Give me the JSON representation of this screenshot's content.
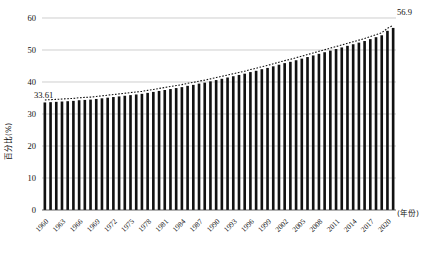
{
  "chart_data": {
    "type": "bar",
    "title": "",
    "subtitle": "",
    "xlabel": "(年份)",
    "ylabel": "百分比(%)",
    "ylim": [
      0,
      60
    ],
    "yticks": [
      0,
      10,
      20,
      30,
      40,
      50,
      60
    ],
    "grid": true,
    "legend": null,
    "annotations": [
      {
        "text": "33.61",
        "x": "1960",
        "value": 33.61
      },
      {
        "text": "56.9",
        "x": "2021",
        "value": 56.9
      }
    ],
    "xtick_labels": [
      "1960",
      "1963",
      "1966",
      "1969",
      "1972",
      "1975",
      "1978",
      "1981",
      "1984",
      "1987",
      "1990",
      "1993",
      "1996",
      "1999",
      "2002",
      "2005",
      "2008",
      "2011",
      "2014",
      "2017",
      "2020"
    ],
    "categories": [
      "1960",
      "1961",
      "1962",
      "1963",
      "1964",
      "1965",
      "1966",
      "1967",
      "1968",
      "1969",
      "1970",
      "1971",
      "1972",
      "1973",
      "1974",
      "1975",
      "1976",
      "1977",
      "1978",
      "1979",
      "1980",
      "1981",
      "1982",
      "1983",
      "1984",
      "1985",
      "1986",
      "1987",
      "1988",
      "1989",
      "1990",
      "1991",
      "1992",
      "1993",
      "1994",
      "1995",
      "1996",
      "1997",
      "1998",
      "1999",
      "2000",
      "2001",
      "2002",
      "2003",
      "2004",
      "2005",
      "2006",
      "2007",
      "2008",
      "2009",
      "2010",
      "2011",
      "2012",
      "2013",
      "2014",
      "2015",
      "2016",
      "2017",
      "2018",
      "2019",
      "2020",
      "2021"
    ],
    "values": [
      33.61,
      33.7,
      33.8,
      33.9,
      34.0,
      34.1,
      34.3,
      34.4,
      34.5,
      34.7,
      34.9,
      35.1,
      35.3,
      35.5,
      35.7,
      35.9,
      36.1,
      36.3,
      36.6,
      36.9,
      37.2,
      37.5,
      37.8,
      38.1,
      38.4,
      38.8,
      39.1,
      39.5,
      39.8,
      40.2,
      40.6,
      41.0,
      41.4,
      41.8,
      42.2,
      42.6,
      43.1,
      43.5,
      44.0,
      44.4,
      44.9,
      45.4,
      45.9,
      46.3,
      46.8,
      47.3,
      47.8,
      48.3,
      48.8,
      49.3,
      49.8,
      50.3,
      50.8,
      51.3,
      51.8,
      52.3,
      52.8,
      53.4,
      54.0,
      54.6,
      56.0,
      56.9
    ],
    "series_overlay": {
      "name": "trend",
      "style": "dotted"
    }
  }
}
